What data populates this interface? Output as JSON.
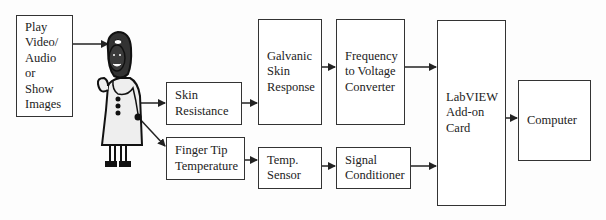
{
  "diagram": {
    "blocks": {
      "stimulus": "Play\nVideo/\nAudio\nor\nShow\nImages",
      "skin_resistance": "Skin\nResistance",
      "finger_tip": "Finger Tip\nTemperature",
      "gsr": "Galvanic\nSkin\nResponse",
      "temp_sensor": "Temp.\nSensor",
      "f2v": "Frequency\nto Voltage\nConverter",
      "signal_conditioner": "Signal\nConditioner",
      "labview": "LabVIEW\nAdd-on\nCard",
      "computer": "Computer"
    },
    "subject_icon": "doctor-figure-icon",
    "edges": [
      [
        "stimulus",
        "subject"
      ],
      [
        "subject",
        "skin_resistance"
      ],
      [
        "subject",
        "finger_tip"
      ],
      [
        "skin_resistance",
        "gsr"
      ],
      [
        "gsr",
        "f2v"
      ],
      [
        "f2v",
        "labview"
      ],
      [
        "finger_tip",
        "temp_sensor"
      ],
      [
        "temp_sensor",
        "signal_conditioner"
      ],
      [
        "signal_conditioner",
        "labview"
      ],
      [
        "labview",
        "computer"
      ]
    ]
  }
}
